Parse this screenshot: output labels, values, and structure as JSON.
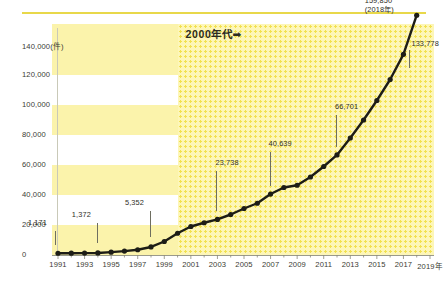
{
  "chart_data": {
    "type": "line",
    "title": "",
    "xlabel": "",
    "ylabel": "件",
    "unit_label": "(件)",
    "ylim": [
      0,
      150000
    ],
    "yticks": [
      0,
      20000,
      40000,
      60000,
      80000,
      100000,
      120000,
      140000
    ],
    "ytick_labels": [
      "0",
      "20,000",
      "40,000",
      "60,000",
      "80,000",
      "100,000",
      "120,000",
      "140,000(件)"
    ],
    "xlim": [
      1991,
      2019
    ],
    "xticks": [
      1991,
      1993,
      1995,
      1997,
      1999,
      2001,
      2003,
      2005,
      2007,
      2009,
      2011,
      2013,
      2015,
      2017,
      2019
    ],
    "xtick_labels": [
      "1991",
      "1993",
      "1995",
      "1997",
      "1999",
      "2001",
      "2003",
      "2005",
      "2007",
      "2009",
      "2011",
      "2013",
      "2015",
      "2017",
      "2019年"
    ],
    "grid": "horizontal-bands",
    "legend": "none",
    "x": [
      1991,
      1992,
      1993,
      1994,
      1995,
      1996,
      1997,
      1998,
      1999,
      2000,
      2001,
      2002,
      2003,
      2004,
      2005,
      2006,
      2007,
      2008,
      2009,
      2010,
      2011,
      2012,
      2013,
      2014,
      2015,
      2016,
      2017,
      2018
    ],
    "values": [
      1171,
      1200,
      1260,
      1372,
      1900,
      2600,
      3500,
      5352,
      9000,
      14500,
      19000,
      21500,
      23738,
      27000,
      31000,
      34500,
      40639,
      45000,
      46500,
      52000,
      59000,
      66701,
      78000,
      90000,
      103000,
      117000,
      133778,
      159850
    ],
    "series": [
      {
        "name": "件数",
        "values": [
          1171,
          1200,
          1260,
          1372,
          1900,
          2600,
          3500,
          5352,
          9000,
          14500,
          19000,
          21500,
          23738,
          27000,
          31000,
          34500,
          40639,
          45000,
          46500,
          52000,
          59000,
          66701,
          78000,
          90000,
          103000,
          117000,
          133778,
          159850
        ]
      }
    ],
    "annotations": [
      {
        "label": "1,171",
        "year": 1991,
        "value": 1171
      },
      {
        "label": "1,372",
        "year": 1994,
        "value": 1372
      },
      {
        "label": "5,352",
        "year": 1998,
        "value": 5352
      },
      {
        "label": "23,738",
        "year": 2003,
        "value": 23738
      },
      {
        "label": "40,639",
        "year": 2007,
        "value": 40639
      },
      {
        "label": "66,701",
        "year": 2012,
        "value": 66701
      },
      {
        "label": "133,778",
        "year": 2017,
        "value": 133778
      },
      {
        "label": "159,850",
        "sub_label": "(2018年)",
        "year": 2018,
        "value": 159850
      }
    ],
    "era_badge": "2000年代➡",
    "era_start_year": 2000,
    "colors": {
      "band": "#fbf3ab",
      "band_alt": "#ffffff",
      "era_fill": "#fdf6b8",
      "era_dot": "#f2e14f",
      "line": "#1d1d16",
      "top_rule": "#e8d84a",
      "axis": "#9a9a8c",
      "text": "#2e2e26"
    }
  }
}
